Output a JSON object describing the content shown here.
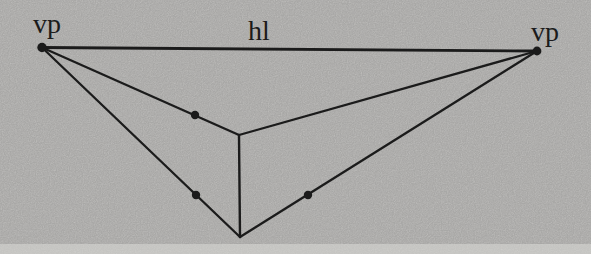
{
  "figure": {
    "type": "diagram",
    "background_color": "#cac9c7",
    "line_color": "#1b1b1b",
    "scan_edge_color": "#dbdad7",
    "labels": {
      "vp_left": {
        "text": "vp",
        "x": 47,
        "y": 33
      },
      "hl": {
        "text": "hl",
        "x": 259,
        "y": 40
      },
      "vp_right": {
        "text": "vp",
        "x": 545,
        "y": 41
      }
    },
    "points": {
      "vp_left": {
        "x": 42,
        "y": 47.5
      },
      "vp_right": {
        "x": 537,
        "y": 51
      },
      "top_corner": {
        "x": 239,
        "y": 135
      },
      "bottom_corner": {
        "x": 240,
        "y": 237
      }
    },
    "edges": [
      {
        "name": "horizon-line",
        "from": "vp_left",
        "to": "vp_right",
        "width": 2.8
      },
      {
        "name": "left-vp-to-top-corner",
        "from": "vp_left",
        "to": "top_corner",
        "width": 2.3
      },
      {
        "name": "left-vp-to-bottom-corner",
        "from": "vp_left",
        "to": "bottom_corner",
        "width": 2.3
      },
      {
        "name": "right-vp-to-top-corner",
        "from": "vp_right",
        "to": "top_corner",
        "width": 2.3
      },
      {
        "name": "right-vp-to-bottom-corner",
        "from": "vp_right",
        "to": "bottom_corner",
        "width": 2.3
      },
      {
        "name": "vertical-corner-edge",
        "from": "top_corner",
        "to": "bottom_corner",
        "width": 2.4
      }
    ],
    "vanishing_point_dots": [
      {
        "name": "vp-left-dot",
        "x": 42,
        "y": 47.5,
        "r": 4.7
      },
      {
        "name": "vp-right-dot",
        "x": 537,
        "y": 51,
        "r": 4.4
      }
    ],
    "marked_points": [
      {
        "name": "marked-point-upper-left",
        "x": 195,
        "y": 115,
        "r": 4.2
      },
      {
        "name": "marked-point-lower-left",
        "x": 196,
        "y": 195,
        "r": 4.2
      },
      {
        "name": "marked-point-lower-right",
        "x": 308,
        "y": 195,
        "r": 4.2
      }
    ]
  }
}
